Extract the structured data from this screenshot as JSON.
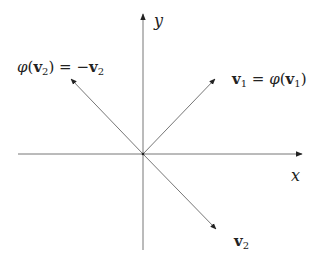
{
  "diagram": {
    "type": "vector-reflection",
    "axes": {
      "x_label": "x",
      "y_label": "y",
      "origin": [
        143,
        154
      ]
    },
    "vectors": [
      {
        "id": "v1",
        "label": "v1 = φ(v1)",
        "tip": [
          215,
          79
        ]
      },
      {
        "id": "minus-v2",
        "label": "φ(v2) = −v2",
        "tip": [
          71,
          79
        ]
      },
      {
        "id": "v2",
        "label": "v2",
        "tip": [
          216,
          229
        ]
      }
    ],
    "labels": {
      "x_axis": "x",
      "y_axis": "y",
      "v1_lhs": "v",
      "v1_sub": "1",
      "v1_eq": " = ",
      "v1_phi": "φ",
      "v1_open": "(",
      "v1_inner": "v",
      "v1_inner_sub": "1",
      "v1_close": ")",
      "v2_phi": "φ",
      "v2_open": "(",
      "v2_inner": "v",
      "v2_inner_sub": "2",
      "v2_close": ")",
      "v2_eq": " = −",
      "v2_rhs": "v",
      "v2_rhs_sub": "2",
      "v2_tip": "v",
      "v2_tip_sub": "2"
    },
    "colors": {
      "line": "#555555",
      "text": "#222222",
      "background": "#ffffff"
    }
  }
}
